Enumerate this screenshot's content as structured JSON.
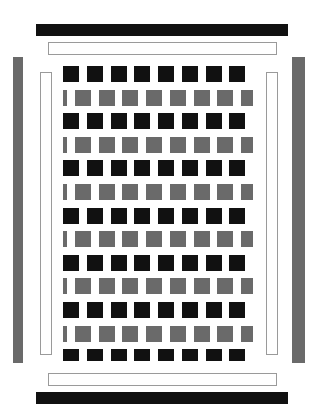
{
  "canvas": {
    "width": 325,
    "height": 420,
    "background": "#ffffff",
    "title": "Woven checkerboard pattern with surrounding frame bars"
  },
  "palette": {
    "dark": "#111111",
    "gray": "#6a6a6a",
    "white": "#ffffff",
    "outline": "#9a9a9a"
  },
  "bars": [
    {
      "name": "top-outer-bar",
      "label": "Top outer solid bar",
      "orientation": "horizontal",
      "style": "solid-dark",
      "fill": "#111111",
      "x": 36,
      "y": 24,
      "width": 252,
      "height": 12
    },
    {
      "name": "top-inner-bar",
      "label": "Top inner outlined bar",
      "orientation": "horizontal",
      "style": "outline",
      "fill": "#ffffff",
      "x": 48,
      "y": 42,
      "width": 229,
      "height": 13
    },
    {
      "name": "left-outer-bar",
      "label": "Left outer solid bar",
      "orientation": "vertical",
      "style": "solid-gray",
      "fill": "#6a6a6a",
      "x": 13,
      "y": 57,
      "width": 10,
      "height": 306
    },
    {
      "name": "right-outer-bar",
      "label": "Right outer solid bar",
      "orientation": "vertical",
      "style": "solid-gray",
      "fill": "#6a6a6a",
      "x": 292,
      "y": 57,
      "width": 13,
      "height": 306
    },
    {
      "name": "left-inner-bar",
      "label": "Left inner outlined bar",
      "orientation": "vertical",
      "style": "outline",
      "fill": "#ffffff",
      "x": 40,
      "y": 72,
      "width": 12,
      "height": 283
    },
    {
      "name": "right-inner-bar",
      "label": "Right inner outlined bar",
      "orientation": "vertical",
      "style": "outline",
      "fill": "#ffffff",
      "x": 266,
      "y": 72,
      "width": 12,
      "height": 283
    },
    {
      "name": "bottom-inner-bar",
      "label": "Bottom inner outlined bar",
      "orientation": "horizontal",
      "style": "outline",
      "fill": "#ffffff",
      "x": 48,
      "y": 373,
      "width": 229,
      "height": 13
    },
    {
      "name": "bottom-outer-bar",
      "label": "Bottom outer solid bar",
      "orientation": "horizontal",
      "style": "solid-dark",
      "fill": "#111111",
      "x": 36,
      "y": 392,
      "width": 252,
      "height": 12
    }
  ],
  "weave": {
    "name": "weave-grid",
    "label": "Basket-weave checkerboard panel",
    "x": 63,
    "y": 66,
    "width": 190,
    "height": 295,
    "columns": 8,
    "rows": 13,
    "period_x": 23.75,
    "period_y": 23.6,
    "block_width": 16,
    "gap_width": 7.75,
    "row_types": [
      "dark",
      "gray",
      "dark",
      "gray",
      "dark",
      "gray",
      "dark",
      "gray",
      "dark",
      "gray",
      "dark",
      "gray",
      "dark"
    ],
    "dark_row": {
      "description": "Row of separated dark squares with white gaps between them",
      "block_fill": "#111111",
      "gap_fill": "#ffffff",
      "block_height": 16,
      "row_height": 16,
      "phase_offset": 0
    },
    "gray_row": {
      "description": "Row of gray bars offset by half a period, white gaps between them",
      "block_fill": "#6a6a6a",
      "gap_fill": "#ffffff",
      "block_height": 16,
      "row_height": 16,
      "phase_offset": 11.875
    }
  }
}
